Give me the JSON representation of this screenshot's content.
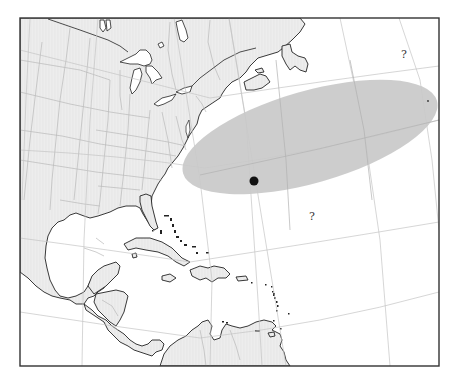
{
  "map": {
    "title": "",
    "frame": {
      "x": 20,
      "y": 18,
      "width": 419,
      "height": 348
    },
    "colors": {
      "background": "#ffffff",
      "land_fill": "#ececec",
      "coastline": "#222222",
      "state_border": "#b9b9b9",
      "graticule": "#c4c4c4",
      "uncertainty_ellipse": "#c9c9c9",
      "marker": "#111111",
      "frame": "#333333"
    },
    "uncertainty_region": {
      "label": "uncertainty-ellipse",
      "center": {
        "x": 310,
        "y": 137
      },
      "rx": 132,
      "ry": 46,
      "rotation_deg": -16
    },
    "marker": {
      "x": 254,
      "y": 181,
      "r": 4.5
    },
    "small_point": {
      "x": 428,
      "y": 101
    },
    "question_marks": [
      {
        "text": "?",
        "x": 401,
        "y": 49
      },
      {
        "text": "?",
        "x": 309,
        "y": 211
      }
    ],
    "regions_shown": [
      "United States (eastern)",
      "Canada (southeastern)",
      "Great Lakes",
      "Gulf of Mexico",
      "Caribbean Sea",
      "Cuba",
      "Hispaniola",
      "Jamaica",
      "Puerto Rico",
      "Lesser Antilles",
      "Central America",
      "Mexico (Yucatán)",
      "Colombia",
      "Venezuela",
      "North Atlantic Ocean"
    ]
  }
}
